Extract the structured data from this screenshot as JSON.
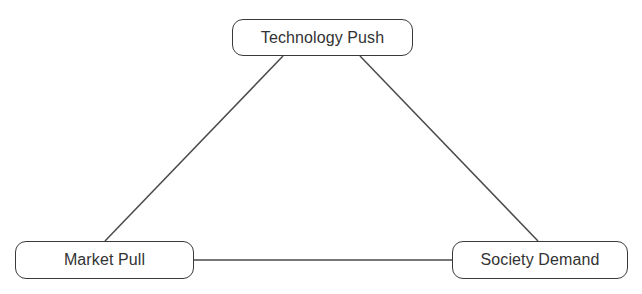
{
  "diagram": {
    "type": "triangle-relationship",
    "nodes": [
      {
        "id": "technology_push",
        "label": "Technology Push",
        "position": "top-center"
      },
      {
        "id": "market_pull",
        "label": "Market Pull",
        "position": "bottom-left"
      },
      {
        "id": "society_demand",
        "label": "Society Demand",
        "position": "bottom-right"
      }
    ],
    "edges": [
      {
        "from": "technology_push",
        "to": "market_pull"
      },
      {
        "from": "technology_push",
        "to": "society_demand"
      },
      {
        "from": "market_pull",
        "to": "society_demand"
      }
    ],
    "colors": {
      "line": "#4a4a4a",
      "border": "#3a3a3a",
      "text": "#333333",
      "background": "#ffffff"
    }
  }
}
